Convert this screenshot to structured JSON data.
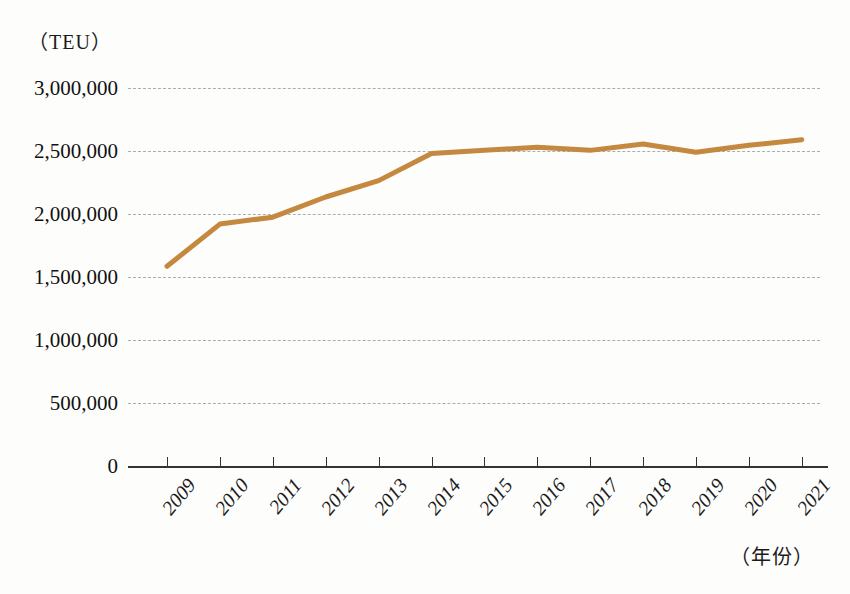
{
  "chart_data": {
    "type": "line",
    "title": "",
    "xlabel": "（年份）",
    "ylabel": "（TEU）",
    "categories": [
      "2009",
      "2010",
      "2011",
      "2012",
      "2013",
      "2014",
      "2015",
      "2016",
      "2017",
      "2018",
      "2019",
      "2020",
      "2021"
    ],
    "values": [
      1585000,
      1920000,
      1975000,
      2135000,
      2265000,
      2480000,
      2505000,
      2530000,
      2505000,
      2555000,
      2490000,
      2545000,
      2590000
    ],
    "series": [
      {
        "name": "集装箱吞吐量",
        "color": "#c4883f",
        "values": [
          1585000,
          1920000,
          1975000,
          2135000,
          2265000,
          2480000,
          2505000,
          2530000,
          2505000,
          2555000,
          2490000,
          2545000,
          2590000
        ]
      }
    ],
    "ylim": [
      0,
      3000000
    ],
    "ytick_values": [
      3000000,
      2500000,
      2000000,
      1500000,
      1000000,
      500000,
      0
    ],
    "ytick_labels": [
      "3,000,000",
      "2,500,000",
      "2,000,000",
      "1,500,000",
      "1,000,000",
      "500,000",
      "0"
    ],
    "grid": "horizontal-dashed",
    "legend": "none",
    "colors": {
      "line": "#c4883f",
      "axis": "#333333",
      "grid": "#9aa0a6",
      "text": "#111111",
      "background": "#fdfdfc"
    }
  }
}
